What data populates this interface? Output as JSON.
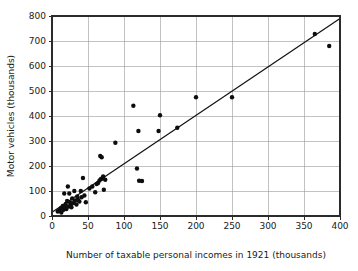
{
  "chart_data": {
    "type": "scatter",
    "title": "",
    "subtitle": "",
    "xlabel": "Number of taxable personal incomes in 1921 (thousands)",
    "ylabel": "Motor vehicles (thousands)",
    "xlim": [
      0,
      400
    ],
    "ylim": [
      0,
      800
    ],
    "xticks": [
      0,
      50,
      100,
      150,
      200,
      250,
      300,
      350,
      400
    ],
    "yticks": [
      0,
      100,
      200,
      300,
      400,
      500,
      600,
      700,
      800
    ],
    "xtick_labels": [
      "0",
      "50",
      "100",
      "150",
      "200",
      "250",
      "300",
      "350",
      "400"
    ],
    "ytick_labels": [
      "0",
      "100",
      "200",
      "300",
      "400",
      "500",
      "600",
      "700",
      "800"
    ],
    "grid": true,
    "grid_axes": "both",
    "legend": false,
    "legend_position": "none",
    "marker": "filled-circle",
    "marker_color": "#0d0d0d",
    "marker_size_px": 2.2,
    "series": [
      {
        "name": "States",
        "points": [
          [
            8,
            18
          ],
          [
            10,
            22
          ],
          [
            12,
            30
          ],
          [
            13,
            14
          ],
          [
            15,
            40
          ],
          [
            16,
            25
          ],
          [
            17,
            90
          ],
          [
            18,
            33
          ],
          [
            19,
            48
          ],
          [
            20,
            28
          ],
          [
            21,
            60
          ],
          [
            22,
            118
          ],
          [
            23,
            38
          ],
          [
            24,
            90
          ],
          [
            25,
            55
          ],
          [
            26,
            44
          ],
          [
            27,
            35
          ],
          [
            28,
            70
          ],
          [
            30,
            52
          ],
          [
            31,
            100
          ],
          [
            32,
            62
          ],
          [
            34,
            46
          ],
          [
            35,
            78
          ],
          [
            36,
            66
          ],
          [
            38,
            58
          ],
          [
            40,
            100
          ],
          [
            41,
            75
          ],
          [
            43,
            152
          ],
          [
            45,
            82
          ],
          [
            47,
            55
          ],
          [
            52,
            110
          ],
          [
            56,
            118
          ],
          [
            60,
            95
          ],
          [
            62,
            128
          ],
          [
            64,
            132
          ],
          [
            66,
            142
          ],
          [
            67,
            240
          ],
          [
            68,
            148
          ],
          [
            69,
            235
          ],
          [
            70,
            150
          ],
          [
            71,
            158
          ],
          [
            72,
            105
          ],
          [
            74,
            145
          ],
          [
            88,
            293
          ],
          [
            113,
            441
          ],
          [
            118,
            190
          ],
          [
            120,
            340
          ],
          [
            121,
            141
          ],
          [
            125,
            140
          ],
          [
            148,
            340
          ],
          [
            150,
            403
          ],
          [
            174,
            353
          ],
          [
            200,
            475
          ],
          [
            250,
            475
          ],
          [
            365,
            728
          ],
          [
            385,
            680
          ]
        ]
      }
    ],
    "fit_line": {
      "type": "linear-regression",
      "x_start": 0,
      "y_start": 15,
      "x_end": 400,
      "y_end": 790
    }
  },
  "axes": {
    "x_axis_name": "x-axis",
    "y_axis_name": "y-axis"
  }
}
